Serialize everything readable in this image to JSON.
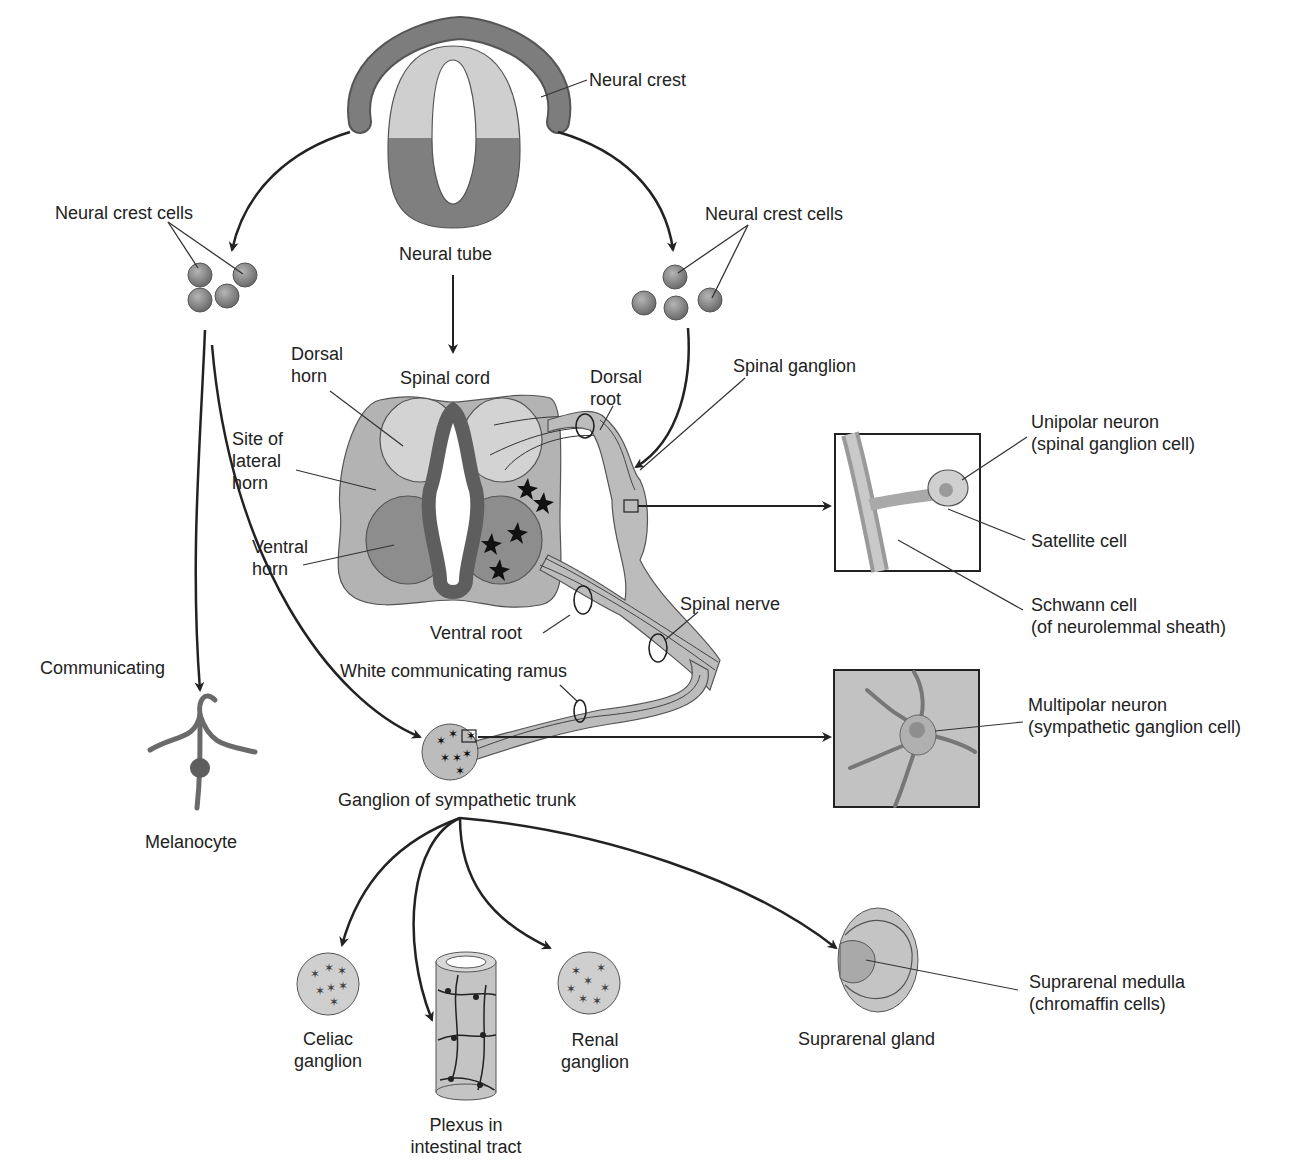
{
  "colors": {
    "background": "#ffffff",
    "light_gray": "#cfcfcf",
    "mid_gray": "#a9a9a9",
    "dark_gray": "#7a7a7a",
    "darker_gray": "#5e5e5e",
    "line": "#222222"
  },
  "labels": {
    "neural_crest": "Neural crest",
    "neural_tube": "Neural tube",
    "neural_crest_cells_left": "Neural crest cells",
    "neural_crest_cells_right": "Neural crest cells",
    "dorsal_horn": [
      "Dorsal",
      "horn"
    ],
    "spinal_cord": "Spinal cord",
    "dorsal_root": [
      "Dorsal",
      "root"
    ],
    "spinal_ganglion": "Spinal ganglion",
    "site_of_lateral_horn": [
      "Site of",
      "lateral",
      "horn"
    ],
    "ventral_horn": [
      "Ventral",
      "horn"
    ],
    "ventral_root": "Ventral root",
    "spinal_nerve": "Spinal nerve",
    "white_communicating_ramus": "White communicating ramus",
    "communicating": "Communicating",
    "melanocyte": "Melanocyte",
    "ganglion_sympathetic_trunk": "Ganglion of sympathetic trunk",
    "unipolar_neuron": [
      "Unipolar neuron",
      "(spinal ganglion cell)"
    ],
    "satellite_cell": "Satellite cell",
    "schwann_cell": [
      "Schwann cell",
      "(of neurolemmal sheath)"
    ],
    "multipolar_neuron": [
      "Multipolar neuron",
      "(sympathetic ganglion cell)"
    ],
    "celiac_ganglion": [
      "Celiac",
      "ganglion"
    ],
    "plexus_intestinal": [
      "Plexus in",
      "intestinal tract"
    ],
    "renal_ganglion": [
      "Renal",
      "ganglion"
    ],
    "suprarenal_gland": "Suprarenal gland",
    "suprarenal_medulla": [
      "Suprarenal medulla",
      "(chromaffin cells)"
    ]
  }
}
